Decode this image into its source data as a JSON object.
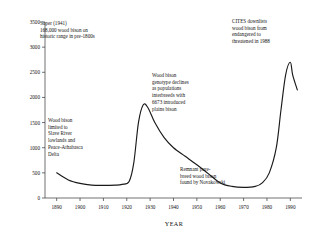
{
  "chart_data": {
    "type": "line",
    "title": "",
    "xlabel": "YEAR",
    "ylabel": "",
    "xlim": [
      1885,
      1995
    ],
    "ylim": [
      0,
      3500
    ],
    "grid": false,
    "legend": "none",
    "xticks": [
      1890,
      1900,
      1910,
      1920,
      1930,
      1940,
      1950,
      1960,
      1970,
      1980,
      1990
    ],
    "yticks": [
      0,
      500,
      1000,
      1500,
      2000,
      2500,
      3000,
      3500
    ],
    "series": [
      {
        "name": "Wood bison population",
        "x": [
          1890,
          1895,
          1900,
          1905,
          1910,
          1915,
          1918,
          1921,
          1923,
          1925,
          1927,
          1929,
          1932,
          1936,
          1940,
          1945,
          1950,
          1955,
          1960,
          1965,
          1970,
          1975,
          1978,
          1981,
          1984,
          1986,
          1988,
          1990,
          1991,
          1993
        ],
        "values": [
          500,
          360,
          290,
          255,
          250,
          255,
          270,
          330,
          700,
          1500,
          1850,
          1800,
          1500,
          1200,
          1000,
          830,
          660,
          480,
          300,
          230,
          210,
          230,
          300,
          500,
          1000,
          1750,
          2450,
          2700,
          2450,
          2150
        ]
      }
    ],
    "annotations": [
      {
        "id": "soper-note",
        "text": "Soper (1941)\n168,000 wood bison on\nhistoric range in pre-1800s",
        "x_px": 40,
        "y_px": 20,
        "boxed": false
      },
      {
        "id": "cites-note",
        "text": "CITES downlists\nwood bison from\nendangered to\nthreatened in 1988",
        "x_px": 232,
        "y_px": 18,
        "boxed": false
      },
      {
        "id": "genotype-note",
        "text": "Wood bison\ngenotype declines\nas populations\ninterbreeds with\n6673 introduced\nplains bison",
        "x_px": 152,
        "y_px": 72,
        "boxed": false
      },
      {
        "id": "range-note",
        "text": "Wood bison\nlimited to\nSlave River\nlowlands and\nPeace-Athabasca\nDelta",
        "x_px": 48,
        "y_px": 117,
        "boxed": false
      },
      {
        "id": "novakowski-note",
        "text": "Remnant pure-\nbreed wood bison\nfound by Novakowski",
        "x_px": 180,
        "y_px": 166,
        "boxed": false
      }
    ]
  },
  "axis": {
    "xlabel": "YEAR",
    "ytick_labels": [
      "0",
      "500",
      "1000",
      "1500",
      "2000",
      "2500",
      "3000",
      "3500"
    ],
    "xtick_labels": [
      "1890",
      "1900",
      "1910",
      "1920",
      "1930",
      "1940",
      "1950",
      "1960",
      "1970",
      "1980",
      "1990"
    ]
  },
  "annotations_text": {
    "soper": "Soper (1941)\n168,000 wood bison on\nhistoric range in pre-1800s",
    "cites": "CITES downlists\nwood bison from\nendangered to\nthreatened in 1988",
    "genotype": "Wood bison\ngenotype declines\nas populations\ninterbreeds with\n6673 introduced\nplains bison",
    "range": "Wood bison\nlimited to\nSlave River\nlowlands and\nPeace-Athabasca\nDelta",
    "novakowski": "Remnant pure-\nbreed wood bison\nfound by Novakowski"
  },
  "style": {
    "line_color": "#1a1a1a",
    "axis_color": "#333333",
    "background": "#ffffff"
  }
}
